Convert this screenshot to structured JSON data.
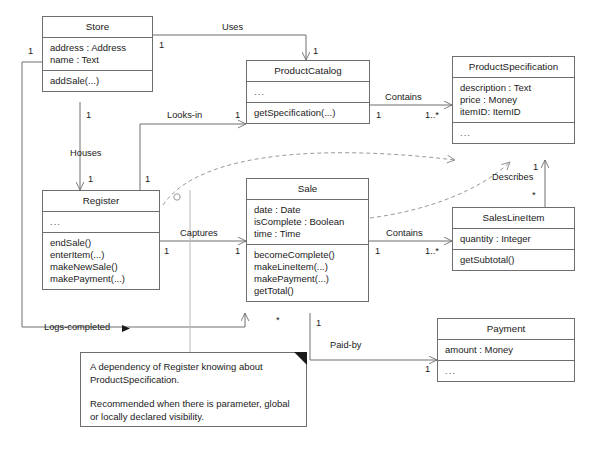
{
  "diagram": {
    "line_color": "#6e6e6e",
    "text_color": "#1a1a1a",
    "background": "#ffffff"
  },
  "classes": {
    "store": {
      "name": "Store",
      "attributes": [
        "address : Address",
        "name : Text"
      ],
      "operations": [
        "addSale(...)"
      ]
    },
    "product_catalog": {
      "name": "ProductCatalog",
      "attributes": [
        "..."
      ],
      "operations": [
        "getSpecification(...)"
      ]
    },
    "product_specification": {
      "name": "ProductSpecification",
      "attributes": [
        "description : Text",
        "price : Money",
        "itemID: ItemID"
      ],
      "operations": [
        "..."
      ]
    },
    "register": {
      "name": "Register",
      "attributes": [
        "..."
      ],
      "operations": [
        "endSale()",
        "enterItem(...)",
        "makeNewSale()",
        "makePayment(...)"
      ]
    },
    "sale": {
      "name": "Sale",
      "attributes": [
        "date : Date",
        "isComplete : Boolean",
        "time : Time"
      ],
      "operations": [
        "becomeComplete()",
        "makeLineItem(...)",
        "makePayment(...)",
        "getTotal()"
      ]
    },
    "sales_line_item": {
      "name": "SalesLineItem",
      "attributes": [
        "quantity : Integer"
      ],
      "operations": [
        "getSubtotal()"
      ]
    },
    "payment": {
      "name": "Payment",
      "attributes": [
        "amount : Money"
      ],
      "operations": [
        "..."
      ]
    }
  },
  "associations": {
    "uses": "Uses",
    "looks_in": "Looks-in",
    "houses": "Houses",
    "captures": "Captures",
    "contains_catalog_spec": "Contains",
    "contains_sale_line": "Contains",
    "describes": "Describes",
    "logs_completed": "Logs-completed",
    "paid_by": "Paid-by"
  },
  "multiplicities": {
    "store_left": "1",
    "store_uses_src": "1",
    "catalog_uses_dst": "1",
    "store_houses_src": "1",
    "register_houses_dst": "1",
    "register_looks_in_src": "1",
    "catalog_looks_in_dst": "1",
    "catalog_contains_src": "1",
    "spec_contains_dst": "1..*",
    "register_captures_src": "1",
    "sale_captures_dst": "1",
    "sale_contains_src": "1",
    "line_contains_dst": "1..*",
    "spec_describes": "1",
    "line_describes": "*",
    "sale_logs_star": "*",
    "sale_paid_by_src": "1",
    "payment_paid_by_dst": "1"
  },
  "note": {
    "paragraph1": "A dependency of Register knowing about ProductSpecification.",
    "paragraph2": "Recommended when there is parameter, global or locally declared visibility."
  }
}
